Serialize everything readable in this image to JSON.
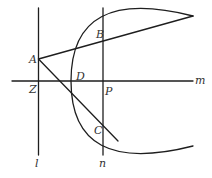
{
  "diagram": {
    "type": "geometry",
    "colors": {
      "line": "#1e1e1e",
      "label": "#333333",
      "background": "#ffffff"
    },
    "lines": {
      "l": {
        "label": "l",
        "kind": "vertical",
        "role": "directrix"
      },
      "n": {
        "label": "n",
        "kind": "vertical",
        "role": "line through P"
      },
      "m": {
        "label": "m",
        "kind": "horizontal",
        "role": "axis"
      }
    },
    "curves": [
      {
        "name": "parabola",
        "vertex": "D",
        "opens": "right"
      }
    ],
    "segments": [
      {
        "name": "tangent-AB",
        "from": "A",
        "through": "B"
      },
      {
        "name": "tangent-AC",
        "from": "A",
        "through": "C"
      }
    ],
    "points": {
      "A": {
        "label": "A",
        "on": "l"
      },
      "B": {
        "label": "B",
        "on": "n ∩ parabola"
      },
      "C": {
        "label": "C",
        "on": "n ∩ parabola"
      },
      "D": {
        "label": "D",
        "on": "vertex of parabola on m"
      },
      "Z": {
        "label": "Z",
        "on": "l ∩ m"
      },
      "P": {
        "label": "P",
        "on": "n ∩ m"
      }
    }
  }
}
